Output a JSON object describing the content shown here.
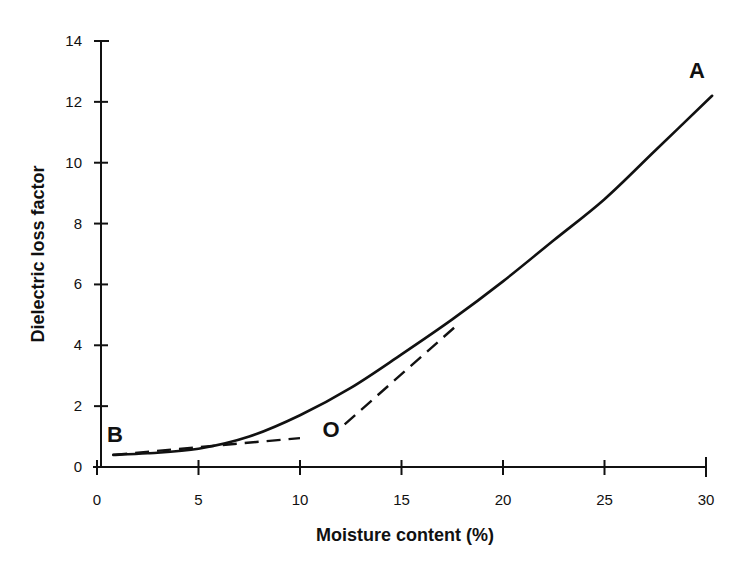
{
  "chart_data": {
    "type": "line",
    "title": "",
    "xlabel": "Moisture content (%)",
    "ylabel": "Dielectric loss factor",
    "xlim": [
      0,
      30
    ],
    "ylim": [
      0,
      14
    ],
    "x_ticks": [
      0,
      5,
      10,
      15,
      20,
      25,
      30
    ],
    "y_ticks": [
      0,
      2,
      4,
      6,
      8,
      10,
      12,
      14
    ],
    "grid": false,
    "legend": null,
    "series": [
      {
        "name": "Loss factor curve (B to A)",
        "style": "solid",
        "x": [
          0.8,
          2.5,
          5,
          7.5,
          10,
          12.5,
          15,
          17.5,
          20,
          22.5,
          25,
          27.5,
          30.3
        ],
        "y": [
          0.4,
          0.45,
          0.6,
          1.0,
          1.7,
          2.6,
          3.7,
          4.85,
          6.1,
          7.45,
          8.8,
          10.4,
          12.2
        ]
      },
      {
        "name": "Low-moisture tangent (from B)",
        "style": "dashed",
        "x": [
          0.8,
          10
        ],
        "y": [
          0.4,
          0.95
        ]
      },
      {
        "name": "High-moisture tangent (from O)",
        "style": "dashed",
        "x": [
          12.2,
          17.8
        ],
        "y": [
          1.4,
          4.7
        ]
      }
    ],
    "annotations": [
      {
        "text": "A",
        "x": 30.0,
        "y": 13.0
      },
      {
        "text": "B",
        "x": 1.0,
        "y": 0.9
      },
      {
        "text": "O",
        "x": 11.8,
        "y": 1.0
      }
    ]
  },
  "labels": {
    "xlabel": "Moisture content (%)",
    "ylabel": "Dielectric loss factor",
    "point_a": "A",
    "point_b": "B",
    "point_o": "O",
    "x_ticks": [
      "0",
      "5",
      "10",
      "15",
      "20",
      "25",
      "30"
    ],
    "y_ticks": [
      "0",
      "2",
      "4",
      "6",
      "8",
      "10",
      "12",
      "14"
    ]
  }
}
